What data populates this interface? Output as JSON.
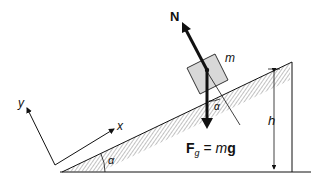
{
  "diagram": {
    "labels": {
      "normal_force": "N",
      "mass": "m",
      "gravity_bold": "F",
      "gravity_sub": "g",
      "gravity_eq": " = ",
      "gravity_m": "m",
      "gravity_g": "g",
      "angle_block": "α",
      "angle_base": "α",
      "height": "h",
      "axis_x": "x",
      "axis_y": "y"
    },
    "colors": {
      "stroke": "#111111",
      "block_fill": "#d8d8d8",
      "hatch": "#555555"
    }
  }
}
